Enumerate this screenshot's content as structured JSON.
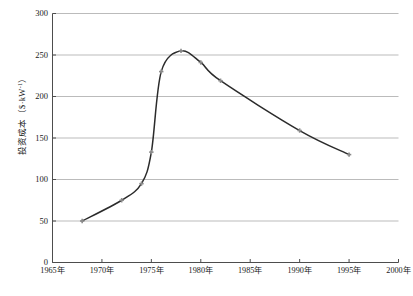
{
  "chart_data": {
    "type": "line",
    "title": "",
    "xlabel": "",
    "ylabel": "投资成本（$·kW⁻¹）",
    "ylabel_plain": "投资成本 ($ · kW-1)",
    "xlim": [
      1965,
      2000
    ],
    "ylim": [
      0,
      300
    ],
    "grid": true,
    "legend": "none",
    "xticks": [
      "1965年",
      "1970年",
      "1975年",
      "1980年",
      "1985年",
      "1990年",
      "1995年",
      "2000年"
    ],
    "xtick_values": [
      1965,
      1970,
      1975,
      1980,
      1985,
      1990,
      1995,
      2000
    ],
    "yticks": [
      "0",
      "50",
      "100",
      "150",
      "200",
      "250",
      "300"
    ],
    "ytick_values": [
      0,
      50,
      100,
      150,
      200,
      250,
      300
    ],
    "series": [
      {
        "name": "投资成本",
        "marker": "cross",
        "color": "#2b2b2b",
        "marker_color": "#8a8a8a",
        "x": [
          1968,
          1972,
          1974,
          1975,
          1976,
          1978,
          1980,
          1982,
          1990,
          1995
        ],
        "values": [
          50,
          75,
          95,
          133,
          230,
          255,
          241,
          219,
          159,
          130
        ]
      }
    ]
  },
  "axis": {
    "grid_color": "#a9a9a9",
    "frame_color": "#4d4d4d"
  },
  "caption": {
    "text": ""
  }
}
